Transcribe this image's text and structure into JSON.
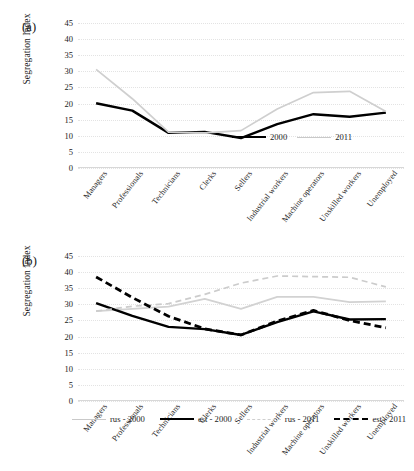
{
  "figures": [
    {
      "id": "a",
      "panel_letter": "(a)",
      "ylabel": "Segregation Index",
      "chart_data": {
        "type": "line",
        "title": "",
        "xlabel": "",
        "ylabel": "Segregation Index",
        "ylim": [
          0,
          45
        ],
        "yticks": [
          0,
          5,
          10,
          15,
          20,
          25,
          30,
          35,
          40,
          45
        ],
        "grid": true,
        "legend_position": "inside-bottom-right",
        "categories": [
          "Managers",
          "Professionals",
          "Technicians",
          "Clerks",
          "Sellers",
          "Industrial workers",
          "Machine operators",
          "Unskilled workers",
          "Unemployed"
        ],
        "series": [
          {
            "name": "2000",
            "style": "solid",
            "color": "#000000",
            "values": [
              20.1,
              17.8,
              10.9,
              11.2,
              9.3,
              13.6,
              16.7,
              15.9,
              17.2
            ]
          },
          {
            "name": "2011",
            "style": "solid",
            "color": "#cfcfcf",
            "values": [
              30.6,
              21.5,
              11.1,
              10.9,
              11.6,
              18.3,
              23.4,
              23.8,
              17.5
            ]
          }
        ]
      },
      "legend": [
        {
          "label": "2000",
          "swatch": "solid-black"
        },
        {
          "label": "2011",
          "swatch": "solid-gray"
        }
      ]
    },
    {
      "id": "b",
      "panel_letter": "(b)",
      "ylabel": "Segregation Index",
      "chart_data": {
        "type": "line",
        "title": "",
        "xlabel": "",
        "ylabel": "Segregation Index",
        "ylim": [
          0,
          45
        ],
        "yticks": [
          0,
          5,
          10,
          15,
          20,
          25,
          30,
          35,
          40,
          45
        ],
        "grid": true,
        "legend_position": "below-plot",
        "categories": [
          "Managers",
          "Professionals",
          "Technicians",
          "Clerks",
          "Sellers",
          "Industrial workers",
          "Machine operators",
          "Unskilled workers",
          "Unemployed"
        ],
        "series": [
          {
            "name": "rus - 2000",
            "style": "solid",
            "color": "#d2d2d2",
            "values": [
              27.9,
              28.6,
              29.3,
              31.7,
              28.6,
              32.3,
              32.3,
              30.7,
              30.9
            ]
          },
          {
            "name": "est - 2000",
            "style": "solid",
            "color": "#000000",
            "values": [
              30.4,
              26.4,
              23.0,
              22.3,
              20.5,
              24.5,
              27.8,
              25.3,
              25.4
            ]
          },
          {
            "name": "rus - 2011",
            "style": "dashed",
            "color": "#cccccc",
            "values": [
              27.9,
              29.4,
              30.2,
              33.1,
              36.6,
              38.8,
              38.6,
              38.4,
              35.4
            ]
          },
          {
            "name": "est - 2011",
            "style": "dashed",
            "color": "#000000",
            "values": [
              38.5,
              32.1,
              26.3,
              22.4,
              20.5,
              24.8,
              28.1,
              25.0,
              22.7
            ]
          }
        ]
      },
      "legend": [
        {
          "label": "rus - 2000",
          "swatch": "solid-gray"
        },
        {
          "label": "est - 2000",
          "swatch": "solid-black"
        },
        {
          "label": "rus - 2011",
          "swatch": "dash-gray"
        },
        {
          "label": "est - 2011",
          "swatch": "dash-black"
        }
      ]
    }
  ]
}
